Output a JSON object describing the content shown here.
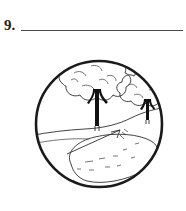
{
  "page": {
    "background_color": "#ffffff",
    "ink_color": "#1a1a1a",
    "line_color": "#4a4a4a"
  },
  "question": {
    "number_label": "9.",
    "answer_line_present": true,
    "answer_value": "",
    "answer_placeholder": ""
  },
  "illustration": {
    "caption": "",
    "frame_shape": "circle",
    "style": "black-and-white line drawing",
    "scene_description": "Two leafy trees on a grassy hill above an oval pond with two arrows",
    "elements": [
      {
        "name": "circle-frame",
        "label": "Circular picture frame"
      },
      {
        "name": "tree-large",
        "label": "Large tree"
      },
      {
        "name": "tree-small",
        "label": "Small tree"
      },
      {
        "name": "hill-horizon",
        "label": "Sloping hill horizon line"
      },
      {
        "name": "pond-oval",
        "label": "Oval pond"
      },
      {
        "name": "arrow-upper",
        "label": "Arrow pointing up and right"
      },
      {
        "name": "arrow-lower",
        "label": "Arrow pointing down and left"
      },
      {
        "name": "ground-contour",
        "label": "Ground contour line"
      }
    ]
  }
}
